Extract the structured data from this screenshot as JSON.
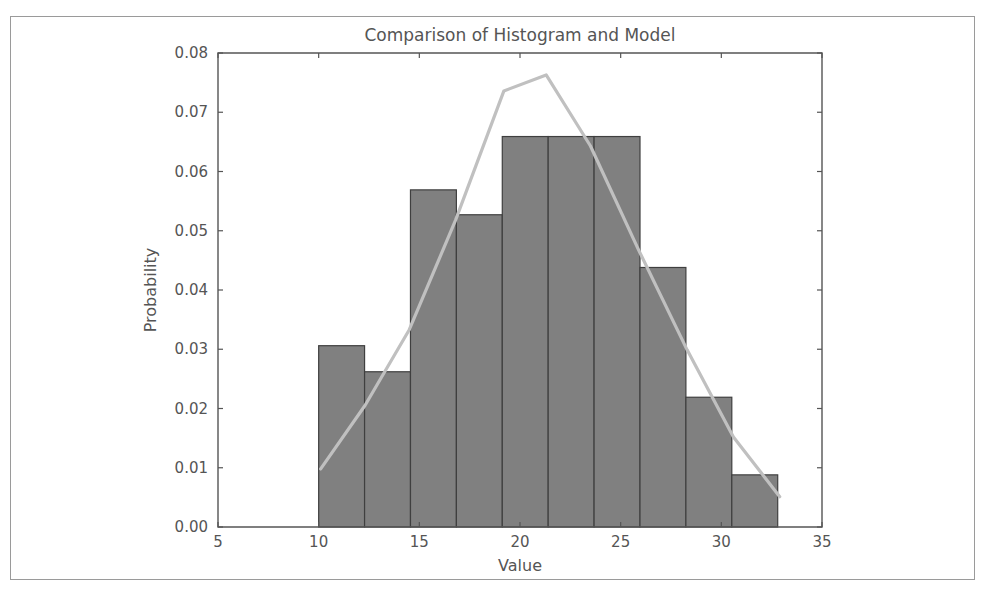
{
  "figure": {
    "background_color": "#ffffff",
    "frame_color": "#9a9a9a",
    "axes_color": "#555555",
    "bar_face_color": "#808080",
    "bar_edge_color": "#3f3f3f",
    "line_color": "#c0c0c0"
  },
  "chart_data": {
    "type": "bar",
    "title": "Comparison of Histogram and Model",
    "xlabel": "Value",
    "ylabel": "Probability",
    "xlim": [
      5,
      35
    ],
    "ylim": [
      0.0,
      0.08
    ],
    "grid": false,
    "legend": null,
    "xticks": [
      5,
      10,
      15,
      20,
      25,
      30,
      35
    ],
    "xtick_labels": [
      "5",
      "10",
      "15",
      "20",
      "25",
      "30",
      "35"
    ],
    "yticks": [
      0.0,
      0.01,
      0.02,
      0.03,
      0.04,
      0.05,
      0.06,
      0.07,
      0.08
    ],
    "ytick_labels": [
      "0.00",
      "0.01",
      "0.02",
      "0.03",
      "0.04",
      "0.05",
      "0.06",
      "0.07",
      "0.08"
    ],
    "bin_edges": [
      10.0,
      12.28,
      14.56,
      16.84,
      19.12,
      21.4,
      23.68,
      25.96,
      28.24,
      30.52,
      32.8
    ],
    "bin_centers": [
      11.14,
      13.42,
      15.7,
      17.98,
      20.26,
      22.54,
      24.82,
      27.1,
      29.38,
      31.66
    ],
    "categories": [
      "10.0-12.3",
      "12.3-14.6",
      "14.6-16.8",
      "16.8-19.1",
      "19.1-21.4",
      "21.4-23.7",
      "23.7-26.0",
      "26.0-28.2",
      "28.2-30.5",
      "30.5-32.8"
    ],
    "values": [
      0.0306,
      0.0262,
      0.0569,
      0.0527,
      0.0659,
      0.0659,
      0.0659,
      0.0438,
      0.0219,
      0.0088
    ],
    "series": [
      {
        "name": "Histogram",
        "type": "bar",
        "values": [
          0.0306,
          0.0262,
          0.0569,
          0.0527,
          0.0659,
          0.0659,
          0.0659,
          0.0438,
          0.0219,
          0.0088
        ]
      },
      {
        "name": "Model",
        "type": "line",
        "x": [
          10.1,
          12.3,
          14.5,
          16.8,
          19.2,
          21.3,
          23.5,
          25.9,
          28.3,
          30.6,
          32.9
        ],
        "y": [
          0.0098,
          0.0205,
          0.0333,
          0.0518,
          0.0736,
          0.0763,
          0.0643,
          0.0467,
          0.0299,
          0.0152,
          0.0051
        ]
      }
    ]
  }
}
